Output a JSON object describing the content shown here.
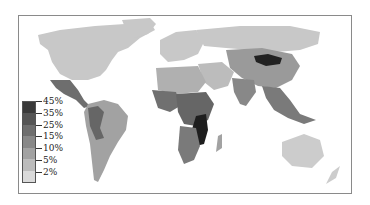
{
  "map": {
    "type": "world choropleth",
    "colors": {
      "ocean": "#ffffff",
      "border": "#8a8a8a"
    }
  },
  "legend": {
    "labels": [
      "45%",
      "35%",
      "25%",
      "15%",
      "10%",
      "5%",
      "2%"
    ],
    "bands": [
      "#3a3a3a",
      "#555555",
      "#6e6e6e",
      "#888888",
      "#a2a2a2",
      "#bcbcbc",
      "#dadada"
    ]
  },
  "regions": [
    {
      "name": "North America",
      "shade": "#c8c8c8"
    },
    {
      "name": "Mexico / Central America",
      "shade": "#6e6e6e"
    },
    {
      "name": "South America",
      "shade": "#a2a2a2"
    },
    {
      "name": "Europe",
      "shade": "#c8c8c8"
    },
    {
      "name": "Russia",
      "shade": "#c8c8c8"
    },
    {
      "name": "Mongolia",
      "shade": "#222222"
    },
    {
      "name": "China",
      "shade": "#9a9a9a"
    },
    {
      "name": "Middle East",
      "shade": "#bcbcbc"
    },
    {
      "name": "India / South Asia",
      "shade": "#888888"
    },
    {
      "name": "Southeast Asia",
      "shade": "#7a7a7a"
    },
    {
      "name": "North Africa",
      "shade": "#b0b0b0"
    },
    {
      "name": "West Africa",
      "shade": "#707070"
    },
    {
      "name": "Central/East Africa",
      "shade": "#666666"
    },
    {
      "name": "Southern Africa highlighted",
      "shade": "#1e1e1e"
    },
    {
      "name": "South Africa",
      "shade": "#7a7a7a"
    },
    {
      "name": "Australia",
      "shade": "#cccccc"
    },
    {
      "name": "New Zealand",
      "shade": "#cccccc"
    }
  ]
}
